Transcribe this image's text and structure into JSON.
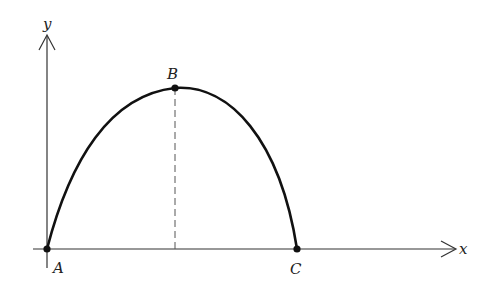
{
  "diagram": {
    "type": "trajectory-curve",
    "axes": {
      "x_label": "x",
      "y_label": "y"
    },
    "points": [
      {
        "id": "A",
        "label": "A",
        "description": "origin, start of curve"
      },
      {
        "id": "B",
        "label": "B",
        "description": "maximum height of curve"
      },
      {
        "id": "C",
        "label": "C",
        "description": "curve returns to x-axis"
      }
    ],
    "dashed_line": "vertical from B to x-axis",
    "colors": {
      "curve": "#111111",
      "axes": "#333333",
      "dashed": "#555555",
      "background": "#ffffff"
    }
  }
}
